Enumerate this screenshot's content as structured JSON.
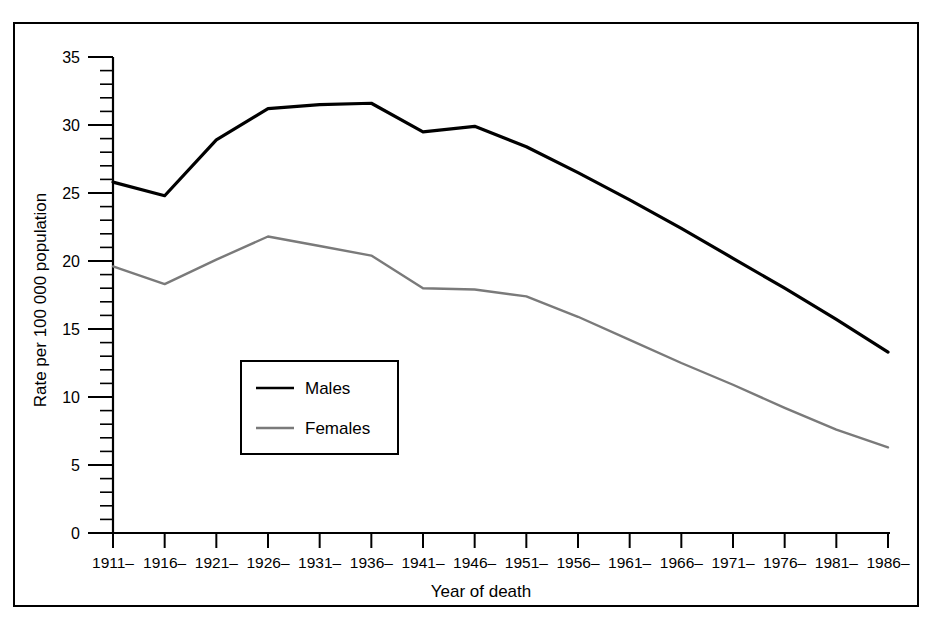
{
  "chart_data": {
    "type": "line",
    "title": "",
    "xlabel": "Year of death",
    "ylabel": "Rate per 100 000 population",
    "categories": [
      "1911–",
      "1916–",
      "1921–",
      "1926–",
      "1931–",
      "1936–",
      "1941–",
      "1946–",
      "1951–",
      "1956–",
      "1961–",
      "1966–",
      "1971–",
      "1976–",
      "1981–",
      "1986–"
    ],
    "series": [
      {
        "name": "Males",
        "color": "#000000",
        "values": [
          25.8,
          24.8,
          28.9,
          31.2,
          31.5,
          31.6,
          29.5,
          29.9,
          28.4,
          26.5,
          24.5,
          22.4,
          20.2,
          18.0,
          15.7,
          13.3
        ]
      },
      {
        "name": "Females",
        "color": "#7a7a7a",
        "values": [
          19.6,
          18.3,
          20.1,
          21.8,
          21.1,
          20.4,
          18.0,
          17.9,
          17.4,
          15.9,
          14.2,
          12.5,
          10.9,
          9.2,
          7.6,
          6.3
        ]
      }
    ],
    "ylim": [
      0,
      35
    ],
    "yticks": [
      0,
      5,
      10,
      15,
      20,
      25,
      30,
      35
    ],
    "ytick_labels": [
      "0",
      "5",
      "10",
      "15",
      "20",
      "25",
      "30",
      "35"
    ],
    "y_minor_tick_step": 1,
    "grid": false,
    "legend_position": "inside-lower-left",
    "legend_entries": [
      "Males",
      "Females"
    ]
  },
  "figure": {
    "border_color": "#000000",
    "background_color": "#ffffff"
  }
}
